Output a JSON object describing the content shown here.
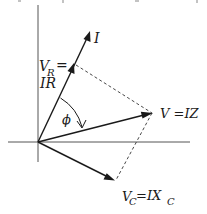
{
  "diagram": {
    "type": "phasor-diagram",
    "labels": {
      "current": "I",
      "vr_main": "V",
      "vr_sub": "R",
      "vr_eq": "=",
      "vr_value": "IR",
      "v_total": "V =IZ",
      "vc_main": "V",
      "vc_sub": "C",
      "vc_eq": " =IX",
      "vc_eq_sub": "C",
      "angle": "ϕ"
    },
    "vectors": [
      {
        "name": "I",
        "from": [
          38,
          142
        ],
        "to": [
          90,
          32
        ]
      },
      {
        "name": "V_R = IR",
        "from": [
          38,
          142
        ],
        "to": [
          74,
          64
        ]
      },
      {
        "name": "V = IZ",
        "from": [
          38,
          142
        ],
        "to": [
          152,
          113
        ]
      },
      {
        "name": "V_C = IX_C",
        "from": [
          38,
          142
        ],
        "to": [
          114,
          180
        ]
      }
    ],
    "dashed_lines": [
      {
        "from": [
          76,
          65
        ],
        "to": [
          152,
          113
        ]
      },
      {
        "from": [
          152,
          113
        ],
        "to": [
          116,
          180
        ]
      }
    ],
    "colors": {
      "ink": "#1a1a1a",
      "axis": "#555555",
      "background": "#ffffff"
    }
  }
}
